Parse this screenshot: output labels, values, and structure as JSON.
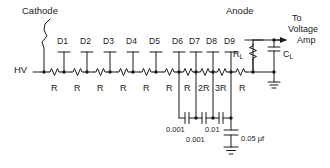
{
  "diagram": {
    "stroke_color": "#1a1a1a",
    "background_color": "#ffffff",
    "labels": {
      "cathode": "Cathode",
      "anode": "Anode",
      "hv": "HV",
      "output_line1": "To",
      "output_line2": "Voltage",
      "output_line3": "Amp",
      "load_resistor": "R",
      "load_resistor_sub": "L",
      "load_capacitor": "C",
      "load_capacitor_sub": "L"
    },
    "dynodes": [
      {
        "label": "D1",
        "x": 64
      },
      {
        "label": "D2",
        "x": 87
      },
      {
        "label": "D3",
        "x": 110
      },
      {
        "label": "D4",
        "x": 133
      },
      {
        "label": "D5",
        "x": 156
      },
      {
        "label": "D6",
        "x": 179
      },
      {
        "label": "D7",
        "x": 196
      },
      {
        "label": "D8",
        "x": 213
      },
      {
        "label": "D9",
        "x": 231
      }
    ],
    "resistors": [
      {
        "label": "R",
        "x": 52
      },
      {
        "label": "R",
        "x": 75
      },
      {
        "label": "R",
        "x": 98
      },
      {
        "label": "R",
        "x": 121
      },
      {
        "label": "R",
        "x": 144
      },
      {
        "label": "R",
        "x": 167
      },
      {
        "label": "R",
        "x": 187
      },
      {
        "label": "2R",
        "x": 204
      },
      {
        "label": "3R",
        "x": 221
      },
      {
        "label": "R",
        "x": 241
      }
    ],
    "capacitors": [
      {
        "label": "0.001",
        "x": 179
      },
      {
        "label": "0.001",
        "x": 196
      },
      {
        "label": "0.01",
        "x": 213
      },
      {
        "label": "0.05 µf",
        "x": 231
      }
    ]
  }
}
